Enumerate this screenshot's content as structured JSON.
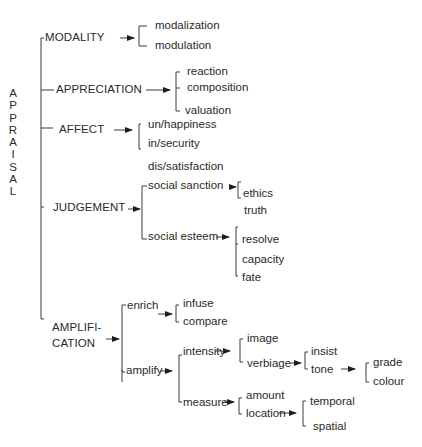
{
  "root": {
    "label": "APPRAISAL",
    "letters": [
      "A",
      "P",
      "P",
      "R",
      "A",
      "I",
      "S",
      "A",
      "L"
    ]
  },
  "systems": {
    "modality": {
      "label": "MODALITY",
      "options": [
        "modalization",
        "modulation"
      ]
    },
    "appreciation": {
      "label": "APPRECIATION",
      "options": [
        "reaction",
        "composition",
        "valuation"
      ]
    },
    "affect": {
      "label": "AFFECT",
      "options": [
        "un/happiness",
        "in/security",
        "dis/satisfaction"
      ]
    },
    "judgement": {
      "label": "JUDGEMENT",
      "social_sanction": {
        "label": "social sanction",
        "options": [
          "ethics",
          "truth"
        ]
      },
      "social_esteem": {
        "label": "social esteem",
        "options": [
          "resolve",
          "capacity",
          "fate"
        ]
      }
    },
    "amplification": {
      "label_line1": "AMPLIFI-",
      "label_line2": "CATION",
      "enrich": {
        "label": "enrich",
        "options": [
          "infuse",
          "compare"
        ]
      },
      "amplify": {
        "label": "amplify",
        "intensity": {
          "label": "intensity",
          "image": "image",
          "verbiage": {
            "label": "verbiage",
            "insist": "insist",
            "tone": {
              "label": "tone",
              "options": [
                "grade",
                "colour"
              ]
            }
          }
        },
        "measure": {
          "label": "measure",
          "amount": "amount",
          "location": {
            "label": "location",
            "options": [
              "temporal",
              "spatial"
            ]
          }
        }
      }
    }
  }
}
